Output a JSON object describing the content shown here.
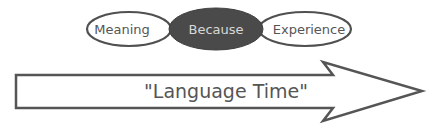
{
  "diagram": {
    "ellipses": [
      {
        "label": "Meaning",
        "filled": false
      },
      {
        "label": "Because",
        "filled": true
      },
      {
        "label": "Experience",
        "filled": false
      }
    ],
    "arrow": {
      "label": "\"Language Time\""
    },
    "colors": {
      "stroke": "#505050",
      "fill_dark": "#4a4a4a",
      "text_light": "#d8d8d8",
      "text_dark": "#555555",
      "background": "#ffffff"
    }
  }
}
